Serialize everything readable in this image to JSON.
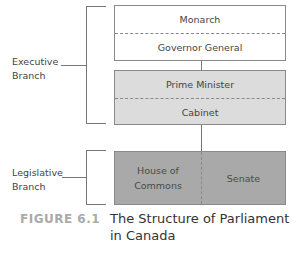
{
  "diagram": {
    "branches": [
      {
        "label_line1": "Executive",
        "label_line2": "Branch"
      },
      {
        "label_line1": "Legislative",
        "label_line2": "Branch"
      }
    ],
    "boxes": {
      "crown": {
        "top": "Monarch",
        "bottom": "Governor General",
        "fill": "#ffffff"
      },
      "executive": {
        "top": "Prime Minister",
        "bottom": "Cabinet",
        "fill": "#dcdcdc"
      },
      "legislature": {
        "left_line1": "House of",
        "left_line2": "Commons",
        "right": "Senate",
        "fill": "#a9a9a9"
      }
    }
  },
  "caption": {
    "number": "FIGURE 6.1",
    "title_line1": "The Structure of Parliament",
    "title_line2": "in Canada"
  }
}
